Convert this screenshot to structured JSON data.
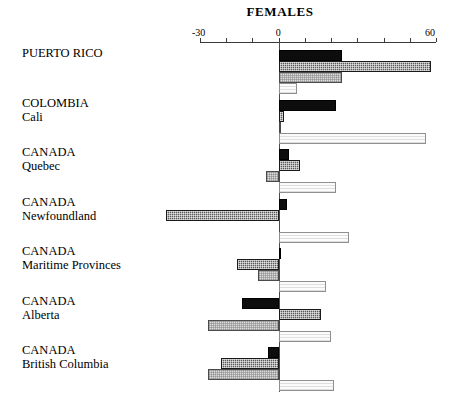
{
  "chart_data": {
    "type": "bar",
    "orientation": "horizontal",
    "title": "FEMALES",
    "xlabel": "",
    "ylabel": "",
    "xlim": [
      -30,
      60
    ],
    "tick_values": [
      -30,
      -20,
      -10,
      0,
      10,
      20,
      30,
      40,
      50,
      60
    ],
    "tick_labels_shown": [
      "-30",
      "0",
      "60"
    ],
    "grid": false,
    "legend": "none",
    "zero_reference_line": true,
    "categories": [
      "PUERTO RICO",
      "COLOMBIA Cali",
      "CANADA Quebec",
      "CANADA Newfoundland",
      "CANADA Maritime Provinces",
      "CANADA Alberta",
      "CANADA British Columbia"
    ],
    "series": [
      {
        "name": "series-1-black",
        "fill": "black",
        "values": [
          24,
          22,
          4,
          3,
          1,
          -14,
          -4
        ]
      },
      {
        "name": "series-2-dark-hatched",
        "fill": "dark-hatched",
        "values": [
          58,
          2,
          8,
          -43,
          -16,
          16,
          -22
        ]
      },
      {
        "name": "series-3-light-hatched",
        "fill": "light-hatched",
        "values": [
          24,
          1,
          -5,
          0,
          -8,
          -27,
          -27
        ]
      },
      {
        "name": "series-4-white",
        "fill": "white",
        "values": [
          7,
          56,
          22,
          27,
          18,
          20,
          21
        ]
      }
    ]
  },
  "axis": {
    "label_min": "-30",
    "label_zero": "0",
    "label_max": "60"
  },
  "categories": [
    {
      "line1": "PUERTO RICO",
      "line2": ""
    },
    {
      "line1": "COLOMBIA",
      "line2": "Cali"
    },
    {
      "line1": "CANADA",
      "line2": "Quebec"
    },
    {
      "line1": "CANADA",
      "line2": "Newfoundland"
    },
    {
      "line1": "CANADA",
      "line2": "Maritime Provinces"
    },
    {
      "line1": "CANADA",
      "line2": "Alberta"
    },
    {
      "line1": "CANADA",
      "line2": "British Columbia"
    }
  ]
}
